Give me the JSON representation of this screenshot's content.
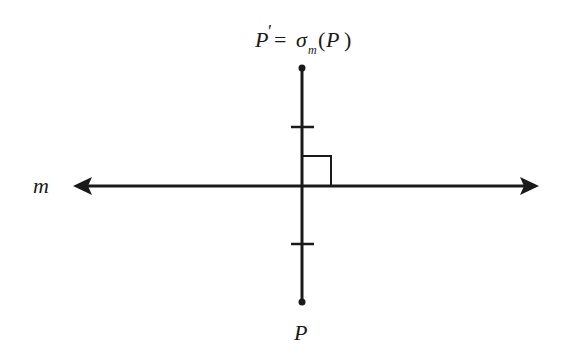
{
  "diagram": {
    "type": "reflection",
    "line_label": "m",
    "point_label": "P",
    "image_label": {
      "prime": "P",
      "prime_mark": "′",
      "equals": "=",
      "sigma": "σ",
      "subscript": "m",
      "open_paren": "(",
      "arg": "P",
      "close_paren": ")"
    },
    "colors": {
      "stroke": "#1a1a1a",
      "background": "#ffffff"
    }
  }
}
